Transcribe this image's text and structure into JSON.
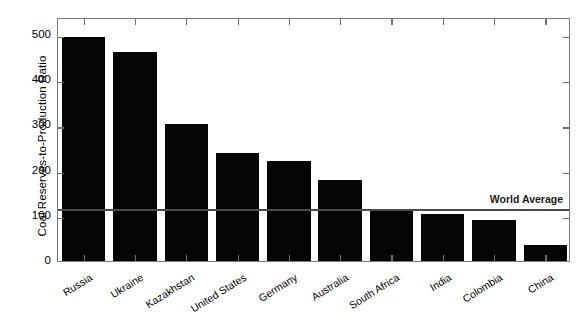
{
  "chart_data": {
    "type": "bar",
    "title": "",
    "subtitle": "",
    "xlabel": "",
    "ylabel": "Coal Reserves-to-Production Ratio",
    "categories": [
      "Russia",
      "Ukraine",
      "Kazakhstan",
      "United States",
      "Germany",
      "Australia",
      "South Africa",
      "India",
      "Colombia",
      "China"
    ],
    "values": [
      495,
      462,
      303,
      240,
      222,
      179,
      115,
      105,
      91,
      35
    ],
    "ylim": [
      0,
      540
    ],
    "yticks": [
      0,
      100,
      200,
      300,
      400,
      500
    ],
    "ytick_labels": [
      "0",
      "100",
      "200",
      "300",
      "400",
      "500"
    ],
    "grid": false,
    "legend": "none",
    "bar_color": "#050505",
    "annotations": [
      {
        "name": "world-average",
        "label": "World Average",
        "value": 117,
        "line_color": "#4a4a4a",
        "orientation": "horizontal"
      }
    ]
  }
}
